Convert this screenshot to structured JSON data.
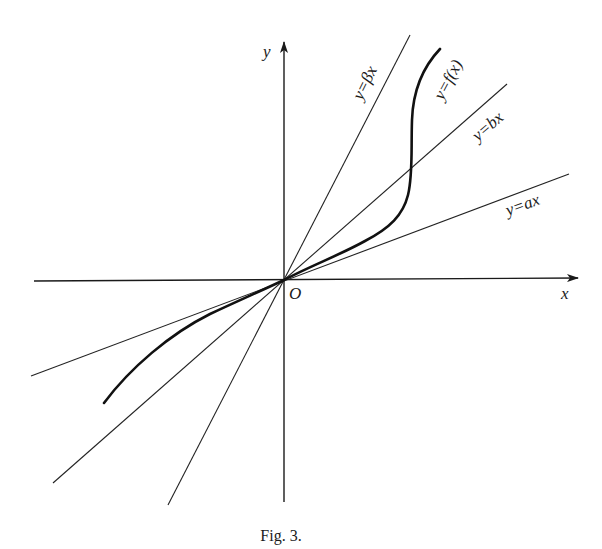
{
  "figure": {
    "caption": "Fig. 3.",
    "origin_label": "O",
    "axes": {
      "x_label": "x",
      "y_label": "y"
    },
    "lines": [
      {
        "id": "beta",
        "label": "y=βx",
        "slope_name": "β"
      },
      {
        "id": "b",
        "label": "y=bx",
        "slope_name": "b"
      },
      {
        "id": "a",
        "label": "y=ax",
        "slope_name": "a"
      }
    ],
    "curve": {
      "label": "y=f(x)"
    },
    "colors": {
      "ink": "#1a1a1a",
      "background": "#ffffff"
    }
  }
}
